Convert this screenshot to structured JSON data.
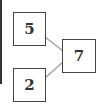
{
  "diagram": {
    "type": "number-bond",
    "parts": [
      {
        "id": "part-top",
        "value": "5"
      },
      {
        "id": "part-bottom",
        "value": "2"
      }
    ],
    "whole": {
      "id": "whole",
      "value": "7"
    },
    "colors": {
      "border": "#444444",
      "line": "#999999",
      "text": "#333333"
    }
  }
}
